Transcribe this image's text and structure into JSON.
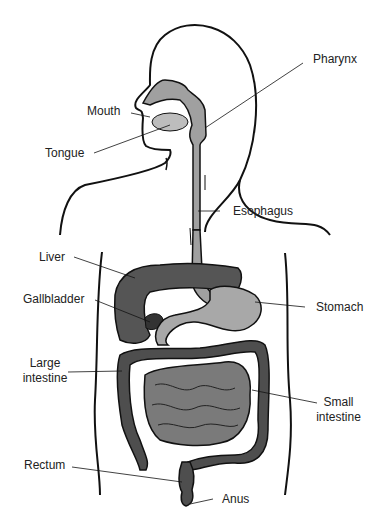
{
  "diagram": {
    "labels": {
      "pharynx": "Pharynx",
      "mouth": "Mouth",
      "tongue": "Tongue",
      "esophagus": "Esophagus",
      "liver": "Liver",
      "gallbladder": "Gallbladder",
      "stomach": "Stomach",
      "large_intestine_1": "Large",
      "large_intestine_2": "intestine",
      "small_intestine_1": "Small",
      "small_intestine_2": "intestine",
      "rectum": "Rectum",
      "anus": "Anus"
    },
    "colors": {
      "outline": "#111111",
      "liver": "#555555",
      "stomach": "#a8a8a8",
      "esophagus": "#a0a0a0",
      "small_intestine": "#7a7a7a",
      "large_intestine": "#4e4e4e",
      "gallbladder": "#333333"
    }
  }
}
